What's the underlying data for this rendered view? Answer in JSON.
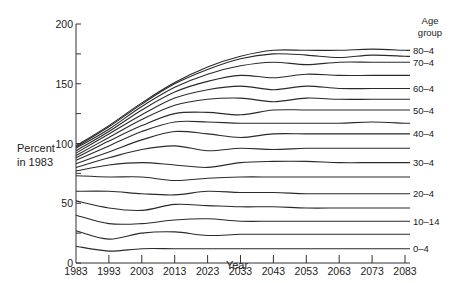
{
  "chart_data": {
    "type": "line",
    "title": "",
    "xlabel": "Year",
    "ylabel": "Percent in 1983",
    "ylabel_lines": [
      "Percent",
      "in 1983"
    ],
    "legend_title_lines": [
      "Age",
      "group"
    ],
    "xlim": [
      1983,
      2088
    ],
    "ylim": [
      0,
      200
    ],
    "x_ticks": [
      1983,
      1993,
      2003,
      2013,
      2023,
      2033,
      2043,
      2053,
      2063,
      2073,
      2083
    ],
    "y_ticks_labeled": [
      0,
      50,
      100,
      150,
      200
    ],
    "y_ticks_minor": [
      25,
      75,
      125,
      175
    ],
    "grid": false,
    "legend_position": "right (direct labels at line ends)",
    "x": [
      1983,
      1993,
      2003,
      2013,
      2023,
      2033,
      2043,
      2053,
      2063,
      2073,
      2083
    ],
    "series": [
      {
        "name": "0-4",
        "label": "0–4",
        "values": [
          14,
          10,
          12,
          12,
          12,
          12,
          12,
          12,
          12,
          12,
          12
        ]
      },
      {
        "name": "5-9",
        "label": "",
        "values": [
          27,
          20,
          25,
          26,
          23,
          24,
          24,
          24,
          24,
          24,
          24
        ]
      },
      {
        "name": "10-14",
        "label": "10–14",
        "values": [
          40,
          33,
          33,
          36,
          37,
          35,
          35,
          35,
          35,
          35,
          35
        ]
      },
      {
        "name": "15-19",
        "label": "",
        "values": [
          52,
          46,
          44,
          49,
          48,
          47,
          47,
          46,
          46,
          46,
          46
        ]
      },
      {
        "name": "20-4",
        "label": "20–4",
        "values": [
          60,
          60,
          58,
          57,
          60,
          59,
          59,
          58,
          58,
          58,
          58
        ]
      },
      {
        "name": "25-9",
        "label": "",
        "values": [
          73,
          72,
          72,
          69,
          71,
          72,
          72,
          72,
          72,
          72,
          72
        ]
      },
      {
        "name": "30-4",
        "label": "30–4",
        "values": [
          77,
          82,
          84,
          82,
          80,
          84,
          85,
          85,
          84,
          84,
          84
        ]
      },
      {
        "name": "35-9",
        "label": "",
        "values": [
          80,
          88,
          95,
          98,
          94,
          96,
          95,
          96,
          96,
          96,
          96
        ]
      },
      {
        "name": "40-4",
        "label": "40–4",
        "values": [
          83,
          93,
          103,
          110,
          108,
          105,
          108,
          108,
          108,
          108,
          108
        ]
      },
      {
        "name": "45-9",
        "label": "",
        "values": [
          86,
          98,
          110,
          118,
          118,
          117,
          117,
          117,
          117,
          118,
          117
        ]
      },
      {
        "name": "50-4",
        "label": "50–4",
        "values": [
          88,
          102,
          115,
          125,
          126,
          124,
          128,
          128,
          128,
          128,
          128
        ]
      },
      {
        "name": "55-9",
        "label": "",
        "values": [
          90,
          105,
          120,
          132,
          137,
          138,
          135,
          138,
          137,
          137,
          137
        ]
      },
      {
        "name": "60-4",
        "label": "60–4",
        "values": [
          92,
          108,
          124,
          138,
          145,
          148,
          145,
          148,
          146,
          146,
          146
        ]
      },
      {
        "name": "65-9",
        "label": "",
        "values": [
          94,
          110,
          128,
          143,
          152,
          157,
          155,
          158,
          157,
          157,
          157
        ]
      },
      {
        "name": "70-4",
        "label": "70–4",
        "values": [
          96,
          112,
          131,
          147,
          158,
          165,
          168,
          166,
          168,
          168,
          168
        ]
      },
      {
        "name": "75-9",
        "label": "",
        "values": [
          97,
          114,
          133,
          150,
          162,
          171,
          175,
          174,
          172,
          174,
          173
        ]
      },
      {
        "name": "80-4",
        "label": "80–4",
        "values": [
          98,
          115,
          134,
          151,
          164,
          173,
          178,
          178,
          178,
          179,
          178
        ]
      }
    ],
    "line_color": "#2a2a2a",
    "background": "#ffffff"
  }
}
